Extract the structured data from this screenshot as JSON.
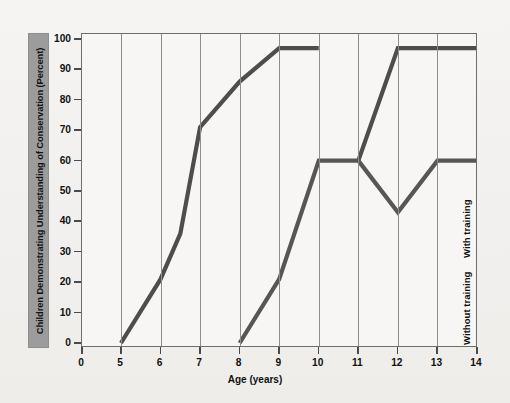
{
  "chart_data": {
    "type": "line",
    "title": "",
    "xlabel": "Age (years)",
    "ylabel": "Children Demonstrating Understanding of Conservation (Percent)",
    "xlim": [
      0,
      14
    ],
    "ylim": [
      0,
      100
    ],
    "xticks": [
      0,
      5,
      6,
      7,
      8,
      9,
      10,
      11,
      12,
      13,
      14
    ],
    "xtick_labels": [
      "0",
      "5",
      "6",
      "7",
      "8",
      "9",
      "10",
      "11",
      "12",
      "13",
      "14"
    ],
    "yticks": [
      0,
      10,
      20,
      30,
      40,
      50,
      60,
      70,
      80,
      90,
      100
    ],
    "ytick_labels": [
      "0",
      "10",
      "20",
      "30",
      "40",
      "50",
      "60",
      "70",
      "80",
      "90",
      "100"
    ],
    "grid": "vertical-only",
    "legend_position": "inline-right-rotated",
    "series": [
      {
        "name": "With training",
        "color": "#4d4d4d",
        "points": [
          {
            "x": 5,
            "y": 0
          },
          {
            "x": 6,
            "y": 21
          },
          {
            "x": 6.5,
            "y": 36
          },
          {
            "x": 7,
            "y": 71
          },
          {
            "x": 8,
            "y": 86
          },
          {
            "x": 9,
            "y": 97
          },
          {
            "x": 10,
            "y": 97
          }
        ],
        "points_continued": [
          {
            "x": 11,
            "y": 60
          },
          {
            "x": 12,
            "y": 97
          },
          {
            "x": 13,
            "y": 97
          },
          {
            "x": 14,
            "y": 97
          }
        ]
      },
      {
        "name": "Without training",
        "color": "#565656",
        "points": [
          {
            "x": 8,
            "y": 0
          },
          {
            "x": 9,
            "y": 21
          },
          {
            "x": 10,
            "y": 60
          },
          {
            "x": 11,
            "y": 60
          },
          {
            "x": 12,
            "y": 43
          },
          {
            "x": 13,
            "y": 60
          },
          {
            "x": 14,
            "y": 60
          }
        ]
      }
    ]
  },
  "axes": {
    "y_title": "Children Demonstrating Understanding of Conservation (Percent)",
    "x_title": "Age (years)"
  },
  "labels": {
    "with_training": "With training",
    "without_training": "Without training"
  },
  "colors": {
    "line": "#4d4d4d",
    "grid": "#8d8d8d",
    "frame": "#6d6d6d",
    "ytitle_band": "#9c9c9c",
    "background": "#f2f1ef",
    "plot_background": "#f7f6f4"
  }
}
